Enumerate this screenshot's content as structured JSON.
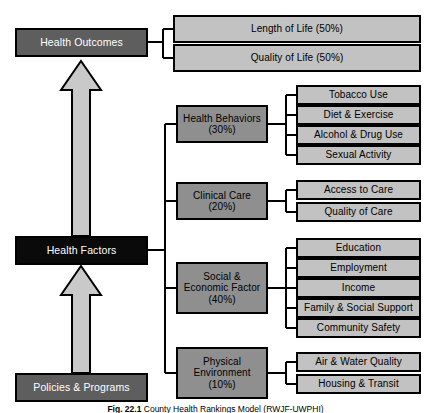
{
  "figure": {
    "caption_label": "Fig. 22.1",
    "caption_text": "County Health Rankings Model (RWJF-UWPHI)"
  },
  "colors": {
    "primary_tier": "#5e5e5e",
    "black_tier": "#0a0a0a",
    "mid_tier": "#8f8f8f",
    "leaf_tier": "#c2c2c2",
    "outline": "#000000",
    "arrow_fill": "#c9c9c9",
    "text_light": "#ffffff",
    "text_dark": "#000000"
  },
  "spine": {
    "health_outcomes": "Health Outcomes",
    "health_factors": "Health Factors",
    "policies_programs": "Policies & Programs"
  },
  "outcomes": [
    {
      "label": "Length of Life (50%)"
    },
    {
      "label": "Quality of Life (50%)"
    }
  ],
  "factors": [
    {
      "label": "Health Behaviors\n(30%)",
      "name": "Health Behaviors",
      "weight": "(30%)",
      "measures": [
        "Tobacco Use",
        "Diet & Exercise",
        "Alcohol & Drug Use",
        "Sexual Activity"
      ]
    },
    {
      "label": "Clinical Care\n(20%)",
      "name": "Clinical Care",
      "weight": "(20%)",
      "measures": [
        "Access to Care",
        "Quality of Care"
      ]
    },
    {
      "label": "Social &\nEconomic Factor\n(40%)",
      "name": "Social & Economic Factor",
      "weight": "(40%)",
      "measures": [
        "Education",
        "Employment",
        "Income",
        "Family & Social Support",
        "Community Safety"
      ]
    },
    {
      "label": "Physical\nEnvironment\n(10%)",
      "name": "Physical Environment",
      "weight": "(10%)",
      "measures": [
        "Air & Water Quality",
        "Housing & Transit"
      ]
    }
  ]
}
